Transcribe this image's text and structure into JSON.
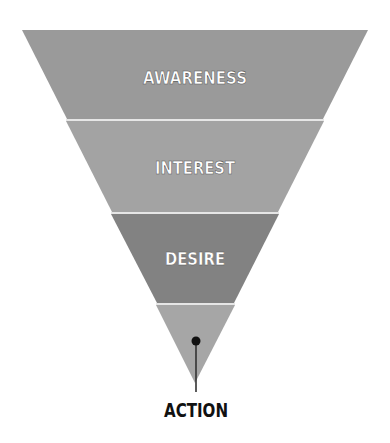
{
  "funnel": {
    "stages": [
      {
        "label": "AWARENESS",
        "color": "#9a9a9a"
      },
      {
        "label": "INTEREST",
        "color": "#a3a3a3"
      },
      {
        "label": "DESIRE",
        "color": "#828282"
      },
      {
        "label": "ACTION",
        "color": "#a6a6a6"
      }
    ],
    "divider_color": "#e6e6e6",
    "action_label": "ACTION",
    "marker_color": "#111111"
  }
}
